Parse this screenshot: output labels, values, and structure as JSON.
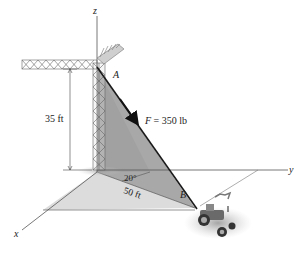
{
  "diagram": {
    "type": "statics-3d-force",
    "axes": {
      "x_label": "x",
      "y_label": "y",
      "z_label": "z"
    },
    "points": {
      "A_label": "A",
      "B_label": "B"
    },
    "force": {
      "symbol": "F",
      "equals": " = 350 lb",
      "magnitude": 350,
      "unit": "lb"
    },
    "dimensions": {
      "height_label": "35 ft",
      "height_value": 35,
      "distance_label": "50 ft",
      "distance_value": 50,
      "angle_label": "20°",
      "angle_value": 20
    },
    "objects": [
      "crane-tower",
      "crane-boom",
      "tractor"
    ],
    "colors": {
      "vertical_plane": "#a9a9a9",
      "ground_plane": "#dadada",
      "axis_line": "#555555",
      "cable": "#1a1a1a",
      "tractor_shadow": "#b8b8b8"
    }
  }
}
